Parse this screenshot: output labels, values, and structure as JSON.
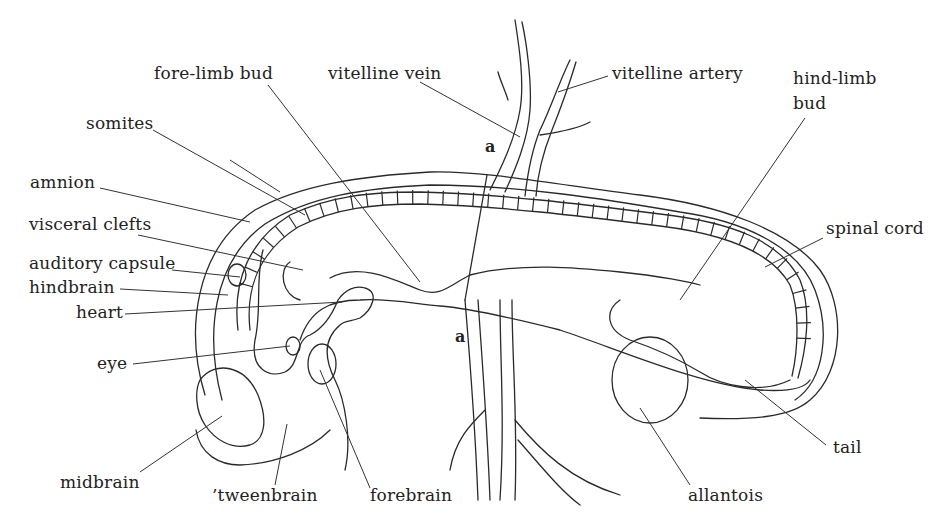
{
  "figure": {
    "line_color": "#2a2a2a",
    "background": "#ffffff"
  },
  "labels": {
    "fore_limb_bud": "fore-limb bud",
    "vitelline_vein": "vitelline vein",
    "vitelline_artery": "vitelline artery",
    "hind_limb_bud_line1": "hind-limb",
    "hind_limb_bud_line2": "bud",
    "somites": "somites",
    "amnion": "amnion",
    "visceral_clefts": "visceral clefts",
    "spinal_cord": "spinal cord",
    "auditory_capsule": "auditory capsule",
    "hindbrain": "hindbrain",
    "heart": "heart",
    "eye": "eye",
    "midbrain": "midbrain",
    "tweenbrain": "’tweenbrain",
    "forebrain": "forebrain",
    "allantois": "allantois",
    "tail": "tail"
  },
  "section_marks": {
    "top": "a",
    "bottom": "a"
  }
}
